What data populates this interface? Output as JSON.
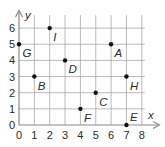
{
  "chart_data": {
    "type": "scatter",
    "title": "",
    "xlabel": "x",
    "ylabel": "y",
    "xlim": [
      0,
      8
    ],
    "ylim": [
      0,
      6
    ],
    "xticks": [
      0,
      1,
      2,
      3,
      4,
      5,
      6,
      7,
      8
    ],
    "yticks": [
      0,
      1,
      2,
      3,
      4,
      5,
      6
    ],
    "grid": true,
    "legend": null,
    "points": [
      {
        "label": "A",
        "x": 6,
        "y": 5,
        "label_pos": "below-right"
      },
      {
        "label": "B",
        "x": 1,
        "y": 3,
        "label_pos": "below-right"
      },
      {
        "label": "C",
        "x": 5,
        "y": 2,
        "label_pos": "below-right"
      },
      {
        "label": "D",
        "x": 3,
        "y": 4,
        "label_pos": "below-right"
      },
      {
        "label": "E",
        "x": 7,
        "y": 0,
        "label_pos": "above-right"
      },
      {
        "label": "F",
        "x": 4,
        "y": 1,
        "label_pos": "below-right"
      },
      {
        "label": "G",
        "x": 0,
        "y": 5,
        "label_pos": "below-right"
      },
      {
        "label": "H",
        "x": 7,
        "y": 3,
        "label_pos": "below-right"
      },
      {
        "label": "I",
        "x": 2,
        "y": 6,
        "label_pos": "below-right"
      }
    ]
  },
  "colors": {
    "point": "#111111",
    "grid": "#a8a8a8",
    "axis": "#8a8a8a",
    "text": "#2a2a2a"
  }
}
